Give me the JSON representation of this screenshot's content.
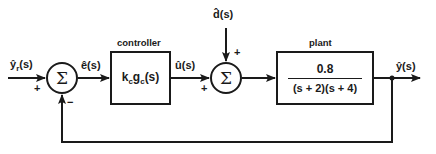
{
  "diagram": {
    "type": "feedback-control-block-diagram",
    "signals": {
      "reference": "ŷr(s)",
      "reference_base": "ŷ",
      "reference_sub": "r",
      "reference_arg": "(s)",
      "error": "ê(s)",
      "control": "û(s)",
      "disturbance": "d̂(s)",
      "output": "ŷ(s)"
    },
    "summers": [
      {
        "id": "sum1",
        "symbol": "Σ",
        "inputs": [
          {
            "signal": "reference",
            "sign": "+"
          },
          {
            "signal": "feedback",
            "sign": "−"
          }
        ]
      },
      {
        "id": "sum2",
        "symbol": "Σ",
        "inputs": [
          {
            "signal": "control",
            "sign": "+"
          },
          {
            "signal": "disturbance",
            "sign": "+"
          }
        ]
      }
    ],
    "blocks": {
      "controller": {
        "caption": "controller",
        "k": "k",
        "k_sub": "c",
        "g": "g",
        "g_sub": "c",
        "arg": "(s)"
      },
      "plant": {
        "caption": "plant",
        "numerator": "0.8",
        "denominator": "(s + 2)(s + 4)"
      }
    },
    "signs": {
      "sum1_plus": "+",
      "sum1_minus": "−",
      "sum2_plus_left": "+",
      "sum2_plus_top": "+"
    },
    "colors": {
      "line": "#1a1a1a",
      "background": "#ffffff"
    }
  }
}
